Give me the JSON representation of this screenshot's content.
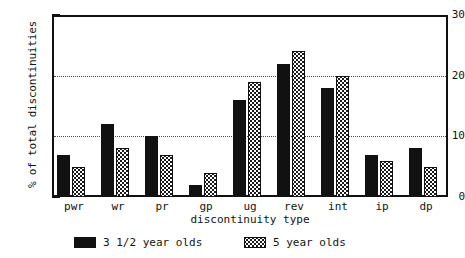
{
  "chart_data": {
    "type": "bar",
    "title": "",
    "xlabel": "discontinuity type",
    "ylabel": "% of total discontinuities",
    "categories": [
      "pwr",
      "wr",
      "pr",
      "gp",
      "ug",
      "rev",
      "int",
      "ip",
      "dp"
    ],
    "series": [
      {
        "name": "3 1/2 year olds",
        "values": [
          7,
          12,
          10,
          2,
          16,
          22,
          18,
          7,
          8
        ],
        "fill": "solid",
        "color": "#111111"
      },
      {
        "name": "5 year olds",
        "values": [
          5,
          8,
          7,
          4,
          19,
          24,
          20,
          6,
          5
        ],
        "fill": "dotted",
        "color": "#1a1a1a"
      }
    ],
    "ylim": [
      0,
      30
    ],
    "ytick_labels": [
      "0",
      "10",
      "20",
      "30"
    ],
    "ytick_values": [
      0,
      10,
      20,
      30
    ],
    "yminor_ticks": [
      2,
      4,
      6,
      8,
      12,
      14,
      16,
      18,
      22,
      24,
      26,
      28
    ],
    "gridlines": [
      10,
      20
    ],
    "grid": true,
    "legend_position": "below-axis"
  },
  "legend": {
    "entries": [
      {
        "label": "3 1/2 year olds",
        "pattern": "solid"
      },
      {
        "label": "5 year olds",
        "pattern": "dotted"
      }
    ]
  },
  "axes": {
    "y_title": "% of total discontinuities",
    "x_title": "discontinuity type"
  }
}
